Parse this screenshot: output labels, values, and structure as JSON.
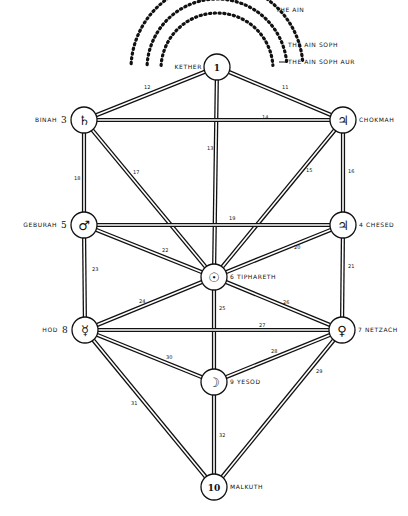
{
  "veils": [
    {
      "label": "THE AIN",
      "x": 276,
      "y": 12,
      "arc_r": 86
    },
    {
      "label": "THE AIN SOPH",
      "x": 288,
      "y": 47,
      "arc_r": 70
    },
    {
      "label": "THE AIN SOPH AUR",
      "x": 288,
      "y": 64,
      "arc_r": 56
    }
  ],
  "sephiroth": [
    {
      "id": "1",
      "name": "KETHER",
      "glyph": "1",
      "x": 217,
      "y": 67,
      "name_pos": "left",
      "number_label": ""
    },
    {
      "id": "2",
      "name": "CHOKMAH",
      "glyph": "♃̶",
      "x": 343,
      "y": 120,
      "name_pos": "right",
      "number_label": ""
    },
    {
      "id": "3",
      "name": "BINAH",
      "glyph": "♄",
      "x": 84,
      "y": 120,
      "name_pos": "left",
      "number_label": "3"
    },
    {
      "id": "4",
      "name": "CHESED",
      "glyph": "♃",
      "x": 343,
      "y": 225,
      "name_pos": "right",
      "number_label": "4"
    },
    {
      "id": "5",
      "name": "GEBURAH",
      "glyph": "♂",
      "x": 84,
      "y": 225,
      "name_pos": "left",
      "number_label": "5"
    },
    {
      "id": "6",
      "name": "TIPHARETH",
      "glyph": "☉",
      "x": 214,
      "y": 277,
      "name_pos": "right",
      "number_label": "6"
    },
    {
      "id": "7",
      "name": "NETZACH",
      "glyph": "♀",
      "x": 342,
      "y": 330,
      "name_pos": "right",
      "number_label": "7"
    },
    {
      "id": "8",
      "name": "HOD",
      "glyph": "☿",
      "x": 85,
      "y": 330,
      "name_pos": "left",
      "number_label": "8"
    },
    {
      "id": "9",
      "name": "YESOD",
      "glyph": "☽",
      "x": 214,
      "y": 382,
      "name_pos": "right",
      "number_label": "9"
    },
    {
      "id": "10",
      "name": "MALKUTH",
      "glyph": "10",
      "x": 214,
      "y": 487,
      "name_pos": "right",
      "number_label": ""
    }
  ],
  "paths": [
    {
      "n": "11",
      "from": "1",
      "to": "2"
    },
    {
      "n": "12",
      "from": "1",
      "to": "3"
    },
    {
      "n": "13",
      "from": "1",
      "to": "6"
    },
    {
      "n": "14",
      "from": "2",
      "to": "3"
    },
    {
      "n": "15",
      "from": "2",
      "to": "6"
    },
    {
      "n": "16",
      "from": "2",
      "to": "4"
    },
    {
      "n": "17",
      "from": "3",
      "to": "6"
    },
    {
      "n": "18",
      "from": "3",
      "to": "5"
    },
    {
      "n": "19",
      "from": "4",
      "to": "5"
    },
    {
      "n": "20",
      "from": "4",
      "to": "6"
    },
    {
      "n": "21",
      "from": "4",
      "to": "7"
    },
    {
      "n": "22",
      "from": "5",
      "to": "6"
    },
    {
      "n": "23",
      "from": "5",
      "to": "8"
    },
    {
      "n": "24",
      "from": "6",
      "to": "7"
    },
    {
      "n": "25",
      "from": "6",
      "to": "9"
    },
    {
      "n": "26",
      "from": "6",
      "to": "8"
    },
    {
      "n": "27",
      "from": "7",
      "to": "8"
    },
    {
      "n": "28",
      "from": "7",
      "to": "9"
    },
    {
      "n": "29",
      "from": "7",
      "to": "10"
    },
    {
      "n": "30",
      "from": "8",
      "to": "9"
    },
    {
      "n": "31",
      "from": "8",
      "to": "10"
    },
    {
      "n": "32",
      "from": "9",
      "to": "10"
    }
  ],
  "path_labels": [
    {
      "n": "11",
      "x": 282,
      "y": 89
    },
    {
      "n": "12",
      "x": 144,
      "y": 89
    },
    {
      "n": "13",
      "x": 207,
      "y": 150
    },
    {
      "n": "14",
      "x": 262,
      "y": 119
    },
    {
      "n": "15",
      "x": 306,
      "y": 172
    },
    {
      "n": "16",
      "x": 348,
      "y": 173
    },
    {
      "n": "17",
      "x": 133,
      "y": 174
    },
    {
      "n": "18",
      "x": 74,
      "y": 180
    },
    {
      "n": "19",
      "x": 229,
      "y": 220
    },
    {
      "n": "20",
      "x": 294,
      "y": 249
    },
    {
      "n": "21",
      "x": 348,
      "y": 268
    },
    {
      "n": "22",
      "x": 162,
      "y": 252
    },
    {
      "n": "23",
      "x": 92,
      "y": 271
    },
    {
      "n": "24",
      "x": 139,
      "y": 303
    },
    {
      "n": "25",
      "x": 219,
      "y": 310
    },
    {
      "n": "26",
      "x": 283,
      "y": 304
    },
    {
      "n": "27",
      "x": 259,
      "y": 327
    },
    {
      "n": "28",
      "x": 271,
      "y": 353
    },
    {
      "n": "29",
      "x": 316,
      "y": 373
    },
    {
      "n": "30",
      "x": 166,
      "y": 359
    },
    {
      "n": "31",
      "x": 131,
      "y": 405
    },
    {
      "n": "32",
      "x": 219,
      "y": 437
    }
  ],
  "colors": {
    "ink": "#111111",
    "paper": "#ffffff"
  }
}
